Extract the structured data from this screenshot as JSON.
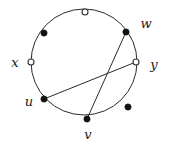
{
  "figure": {
    "type": "graph-diagram",
    "title": "",
    "canvas": {
      "width": 174,
      "height": 145,
      "background": "#ffffff"
    },
    "circle": {
      "center_x": 84,
      "center_y": 62,
      "radius": 53,
      "stroke": "#2b2b2b",
      "stroke_width": 1,
      "fill": "none"
    },
    "style": {
      "filled_marker_fill": "#111111",
      "filled_marker_stroke": "#111111",
      "open_marker_fill": "#ffffff",
      "open_marker_stroke": "#333333",
      "marker_radius_filled": 3.1,
      "marker_radius_open": 3.0,
      "chord_stroke": "#2b2b2b",
      "chord_width": 1,
      "label_color": "#1a1a1a"
    },
    "vertices": [
      {
        "id": "top",
        "label": "",
        "marker": "open",
        "x": 85,
        "y": 12,
        "label_x": 0,
        "label_y": 0
      },
      {
        "id": "upper-left",
        "label": "",
        "marker": "filled",
        "x": 44,
        "y": 33,
        "label_x": 0,
        "label_y": 0
      },
      {
        "id": "x",
        "label": "x",
        "marker": "open",
        "x": 31,
        "y": 62,
        "label_x": 15,
        "label_y": 62
      },
      {
        "id": "u",
        "label": "u",
        "marker": "filled",
        "x": 44,
        "y": 99,
        "label_x": 29,
        "label_y": 101
      },
      {
        "id": "v",
        "label": "v",
        "marker": "filled",
        "x": 87,
        "y": 119,
        "label_x": 88,
        "label_y": 134
      },
      {
        "id": "lower-right",
        "label": "",
        "marker": "filled",
        "x": 128,
        "y": 107,
        "label_x": 0,
        "label_y": 0
      },
      {
        "id": "y",
        "label": "y",
        "marker": "open",
        "x": 136,
        "y": 62,
        "label_x": 154,
        "label_y": 64
      },
      {
        "id": "w",
        "label": "w",
        "marker": "filled",
        "x": 126,
        "y": 32,
        "label_x": 146,
        "label_y": 23
      }
    ],
    "chords": [
      {
        "id": "chord-u-y",
        "from": "u",
        "to": "y",
        "x1": 44,
        "y1": 99,
        "x2": 136,
        "y2": 62
      },
      {
        "id": "chord-v-w",
        "from": "v",
        "to": "w",
        "x1": 87,
        "y1": 119,
        "x2": 126,
        "y2": 32
      }
    ],
    "labels_visible": [
      "x",
      "u",
      "v",
      "y",
      "w"
    ],
    "counts": {
      "total_vertices": 8,
      "filled_vertices": 5,
      "open_vertices": 3,
      "chords": 2
    }
  }
}
